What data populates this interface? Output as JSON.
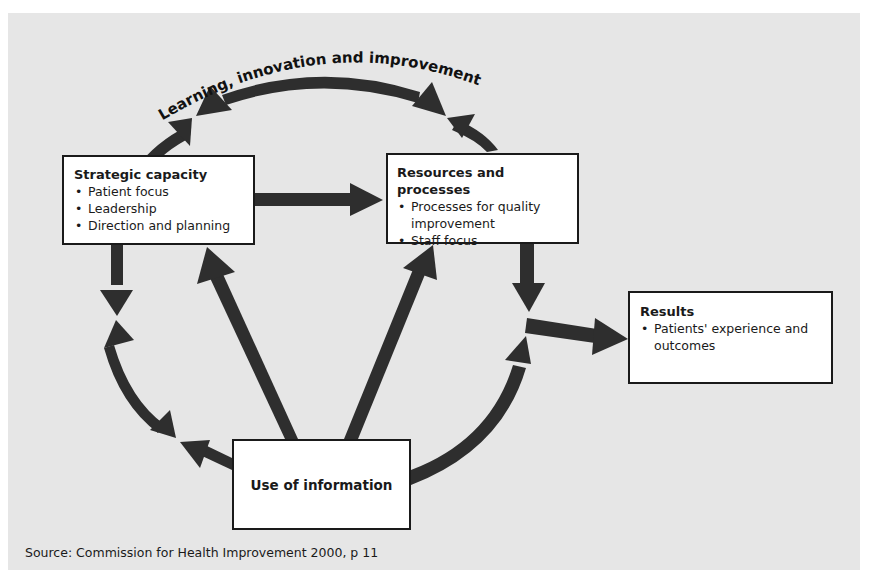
{
  "figure": {
    "label_fragment": "g",
    "arc_label": "Learning, innovation and improvement",
    "colors": {
      "panel": "#e6e6e6",
      "arrow": "#2e2e2e",
      "box_fill": "#ffffff",
      "box_border": "#1a1a1a"
    }
  },
  "nodes": {
    "strategic": {
      "title": "Strategic capacity",
      "items": [
        "Patient focus",
        "Leadership",
        "Direction and planning"
      ]
    },
    "resources": {
      "title": "Resources and processes",
      "items": [
        "Processes for quality improvement",
        "Staff focus"
      ]
    },
    "results": {
      "title": "Results",
      "items": [
        "Patients' experience and outcomes"
      ]
    },
    "information": {
      "title": "Use of information"
    }
  },
  "edges": [
    {
      "from": "strategic",
      "to": "resources",
      "type": "straight"
    },
    {
      "from": "information",
      "to": "strategic",
      "type": "straight"
    },
    {
      "from": "information",
      "to": "resources",
      "type": "straight"
    },
    {
      "from": "resources",
      "to": "results",
      "type": "curved-then-straight"
    },
    {
      "from": "information",
      "to": "results",
      "type": "curved"
    },
    {
      "from": "learning-loop",
      "to": "all",
      "type": "circular double-headed"
    }
  ],
  "source": "Source: Commission for Health Improvement 2000, p 11"
}
